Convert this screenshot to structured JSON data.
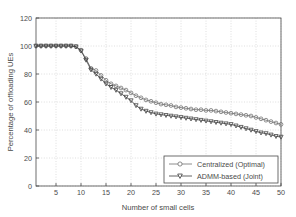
{
  "chart_data": {
    "type": "line",
    "title": "",
    "xlabel": "Number of small cells",
    "ylabel": "Percentage of offloading UEs",
    "xlim": [
      1,
      50
    ],
    "ylim": [
      0,
      120
    ],
    "xticks": [
      5,
      10,
      15,
      20,
      25,
      30,
      35,
      40,
      45,
      50
    ],
    "yticks": [
      0,
      20,
      40,
      60,
      80,
      100,
      120
    ],
    "grid": true,
    "legend_position": "lower right",
    "colors": {
      "centralized": "#6e6e6e",
      "admm": "#3c3c3c",
      "axis": "#4a4a4a",
      "grid": "#bdbdbd",
      "background": "#ffffff"
    },
    "x": [
      1,
      2,
      3,
      4,
      5,
      6,
      7,
      8,
      9,
      10,
      11,
      12,
      13,
      14,
      15,
      16,
      17,
      18,
      19,
      20,
      21,
      22,
      23,
      24,
      25,
      26,
      27,
      28,
      29,
      30,
      31,
      32,
      33,
      34,
      35,
      36,
      37,
      38,
      39,
      40,
      41,
      42,
      43,
      44,
      45,
      46,
      47,
      48,
      49,
      50
    ],
    "series": [
      {
        "name": "Centralized (Optimal)",
        "marker": "circle",
        "values": [
          100,
          100,
          100,
          100,
          100,
          100,
          100,
          100,
          99.5,
          97,
          91,
          84,
          82.5,
          79,
          75.5,
          73,
          71.5,
          70,
          68.5,
          66.5,
          64.5,
          63,
          61.5,
          60.5,
          59.5,
          58.5,
          58,
          57.5,
          56.5,
          56,
          55.5,
          55,
          54.5,
          54.5,
          54,
          54,
          53.5,
          53,
          52.5,
          52,
          51.5,
          51,
          50.5,
          50,
          49,
          48,
          47,
          46,
          45,
          44
        ]
      },
      {
        "name": "ADMM-based (Joint)",
        "marker": "triangle-down",
        "values": [
          100,
          100,
          100,
          100,
          100,
          100,
          100,
          100,
          99.5,
          96.5,
          90,
          83,
          80,
          76.5,
          73,
          70.5,
          68.5,
          66,
          63.5,
          61,
          57.5,
          55,
          53.5,
          52.5,
          51.5,
          51,
          50.5,
          50,
          49.5,
          49,
          48.5,
          48,
          47.5,
          47,
          46.5,
          46,
          45.5,
          45,
          44.5,
          44,
          43,
          42,
          41,
          40,
          39,
          38,
          37.5,
          36.5,
          35.5,
          35
        ]
      }
    ]
  }
}
